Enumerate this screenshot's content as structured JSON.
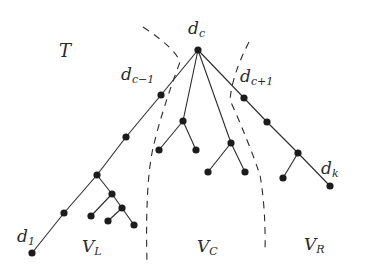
{
  "diagram": {
    "title_label": "T",
    "nodes": {
      "root": {
        "main": "d",
        "sub": "c",
        "x": 198,
        "y": 50
      },
      "left_neighbor": {
        "main": "d",
        "sub": "c−1",
        "x": 161,
        "y": 95
      },
      "right_neighbor": {
        "main": "d",
        "sub": "c+1",
        "x": 244,
        "y": 98
      },
      "first": {
        "main": "d",
        "sub": "1",
        "x": 32,
        "y": 253
      },
      "last": {
        "main": "d",
        "sub": "k",
        "x": 330,
        "y": 186
      }
    },
    "regions": [
      {
        "main": "V",
        "sub": "L"
      },
      {
        "main": "V",
        "sub": "C"
      },
      {
        "main": "V",
        "sub": "R"
      }
    ],
    "edges": [
      [
        198,
        50,
        161,
        95
      ],
      [
        161,
        95,
        126,
        137
      ],
      [
        126,
        137,
        97,
        175
      ],
      [
        97,
        175,
        64,
        213
      ],
      [
        64,
        213,
        32,
        253
      ],
      [
        97,
        175,
        112,
        194
      ],
      [
        112,
        194,
        91,
        216
      ],
      [
        112,
        194,
        122,
        208
      ],
      [
        122,
        208,
        108,
        221
      ],
      [
        122,
        208,
        134,
        225
      ],
      [
        198,
        50,
        183,
        121
      ],
      [
        183,
        121,
        159,
        150
      ],
      [
        183,
        121,
        196,
        150
      ],
      [
        198,
        50,
        231,
        143
      ],
      [
        231,
        143,
        208,
        172
      ],
      [
        231,
        143,
        245,
        172
      ],
      [
        198,
        50,
        244,
        98
      ],
      [
        244,
        98,
        267,
        122
      ],
      [
        267,
        122,
        298,
        153
      ],
      [
        298,
        153,
        283,
        178
      ],
      [
        298,
        153,
        330,
        186
      ]
    ],
    "points": [
      [
        198,
        50
      ],
      [
        161,
        95
      ],
      [
        126,
        137
      ],
      [
        97,
        175
      ],
      [
        64,
        213
      ],
      [
        32,
        253
      ],
      [
        112,
        194
      ],
      [
        91,
        216
      ],
      [
        122,
        208
      ],
      [
        108,
        221
      ],
      [
        134,
        225
      ],
      [
        183,
        121
      ],
      [
        159,
        150
      ],
      [
        196,
        150
      ],
      [
        231,
        143
      ],
      [
        208,
        172
      ],
      [
        245,
        172
      ],
      [
        244,
        98
      ],
      [
        267,
        122
      ],
      [
        298,
        153
      ],
      [
        283,
        178
      ],
      [
        330,
        186
      ]
    ],
    "colors": {
      "ink": "#2a2a2a",
      "node": "#1c1c1c",
      "background": "#ffffff"
    }
  }
}
